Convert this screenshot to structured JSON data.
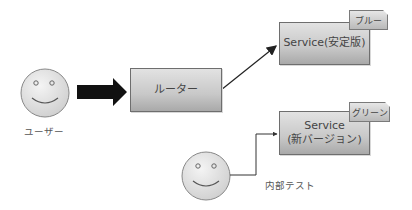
{
  "diagram": {
    "actors": {
      "user": {
        "label": "ユーザー"
      },
      "internal": {
        "label": "内部テスト"
      }
    },
    "router": {
      "label": "ルーター"
    },
    "services": {
      "blue": {
        "label": "Service(安定版)",
        "tag": "ブルー"
      },
      "green": {
        "label_line1": "Service",
        "label_line2": "(新バージョン)",
        "tag": "グリーン"
      }
    },
    "edges": [
      {
        "from": "user",
        "to": "router",
        "style": "thick-arrow"
      },
      {
        "from": "router",
        "to": "service-blue",
        "style": "arrow"
      },
      {
        "from": "internal",
        "to": "service-green",
        "style": "elbow-arrow"
      }
    ]
  }
}
